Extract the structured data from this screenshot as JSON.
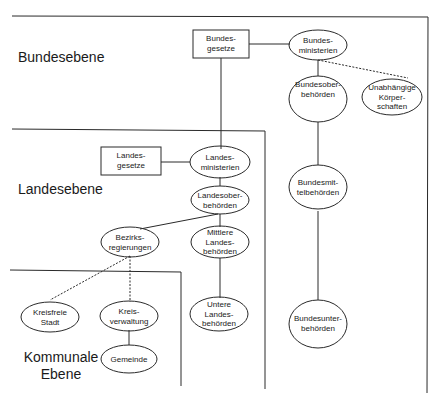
{
  "levels": {
    "bund": "Bundesebene",
    "land": "Landesebene",
    "kommunal": "Kommunale\nEbene"
  },
  "nodes": {
    "bundesgesetze": "Bundes-\ngesetze",
    "bundesministerien": "Bundes-\nministerien",
    "bundesoberbehoerden": "Bundesober-\nbehörden",
    "unabhaengige_koerperschaften": "Unabhängige\nKörper-\nschaften",
    "bundesmittelbehoerden": "Bundesmit-\ntelbehörden",
    "bundesunterbehoerden": "Bundesunter-\nbehörden",
    "landesgesetze": "Landes-\ngesetze",
    "landesministerien": "Landes-\nministerien",
    "landesoberbehoerden": "Landesober-\nbehörden",
    "bezirksregierungen": "Bezirks-\nregierungen",
    "mittlere_landesbehoerden": "Mittlere\nLandes-\nbehörden",
    "untere_landesbehoerden": "Untere\nLandes-\nbehörden",
    "kreisfreie_stadt": "Kreisfreie\nStadt",
    "kreisverwaltung": "Kreis-\nverwaltung",
    "gemeinde": "Gemeinde"
  },
  "colors": {
    "line": "#2a2a2a",
    "background": "#ffffff"
  }
}
